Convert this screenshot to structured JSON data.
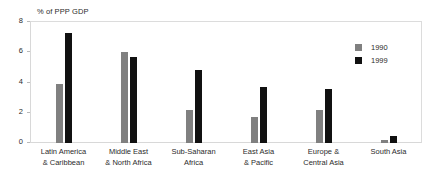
{
  "chart_data": {
    "type": "bar",
    "title": "",
    "axis_note": "% of PPP GDP",
    "xlabel": "",
    "ylabel": "% of PPP GDP",
    "ylim": [
      0,
      8
    ],
    "yticks": [
      0,
      2,
      4,
      6,
      8
    ],
    "grid": false,
    "legend_position": "top-right",
    "categories": [
      "Latin America & Caribbean",
      "Middle East & North Africa",
      "Sub-Saharan Africa",
      "East Asia & Pacific",
      "Europe & Central Asia",
      "South Asia"
    ],
    "category_lines": [
      [
        "Latin America",
        "& Caribbean"
      ],
      [
        "Middle East",
        "& North Africa"
      ],
      [
        "Sub-Saharan",
        "Africa"
      ],
      [
        "East Asia",
        "& Pacific"
      ],
      [
        "Europe &",
        "Central Asia"
      ],
      [
        "South Asia"
      ]
    ],
    "series": [
      {
        "name": "1990",
        "color": "#808080",
        "values": [
          3.9,
          6.0,
          2.2,
          1.7,
          2.2,
          0.2
        ]
      },
      {
        "name": "1999",
        "color": "#111111",
        "values": [
          7.3,
          5.7,
          4.8,
          3.7,
          3.6,
          0.45
        ]
      }
    ]
  },
  "legend": {
    "items": [
      {
        "label": "1990"
      },
      {
        "label": "1999"
      }
    ]
  }
}
